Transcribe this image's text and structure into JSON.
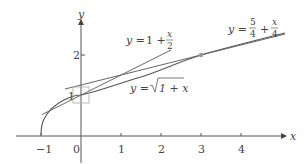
{
  "diagram": {
    "axes": {
      "x_label": "x",
      "y_label": "y",
      "x_ticks": [
        "−1",
        "0",
        "1",
        "2",
        "3",
        "4"
      ],
      "y_ticks": [
        "1",
        "2"
      ]
    },
    "curves": {
      "tangent_at_0": {
        "lhs": "y =",
        "rhs": "1 +",
        "frac_num": "x",
        "frac_den": "2"
      },
      "sqrt_curve": {
        "lhs": "y =",
        "radicand": "1 + x"
      },
      "tangent_at_3": {
        "lhs": "y =",
        "frac1_num": "5",
        "frac1_den": "4",
        "plus": "+",
        "frac2_num": "x",
        "frac2_den": "4"
      }
    },
    "marked_point": {
      "x": 3,
      "y": 2
    },
    "colors": {
      "axis": "#555555",
      "curve": "#555555",
      "tangent": "#666666",
      "box": "#aaaaaa",
      "point": "#999999"
    }
  }
}
